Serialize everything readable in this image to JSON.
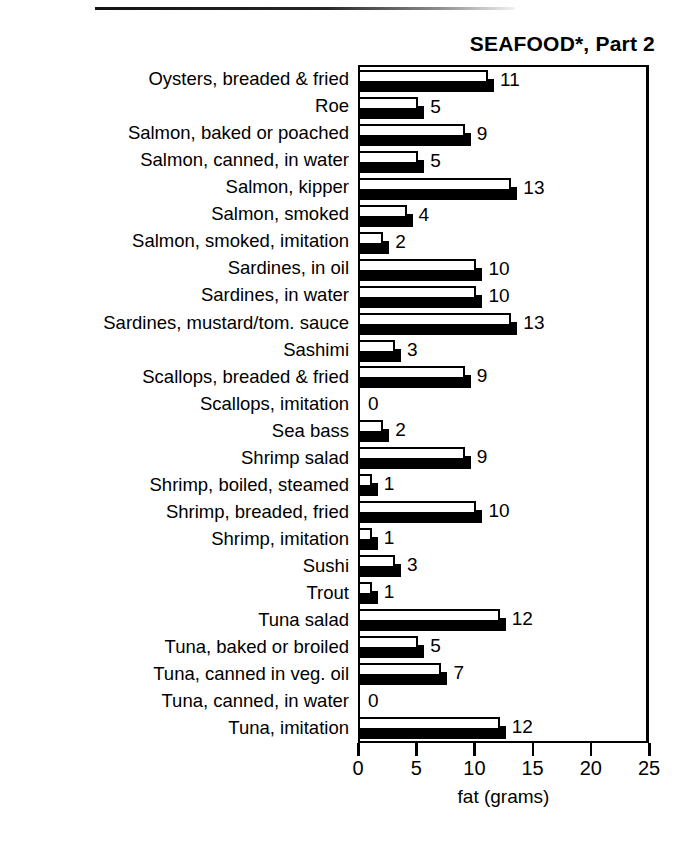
{
  "chart_data": {
    "type": "bar",
    "orientation": "horizontal",
    "title": "SEAFOOD*, Part 2",
    "xlabel": "fat (grams)",
    "ylabel": "",
    "xlim": [
      0,
      25
    ],
    "xticks": [
      0,
      5,
      10,
      15,
      20,
      25
    ],
    "xtick_labels": [
      "0",
      "5",
      "10",
      "15",
      "20",
      "25"
    ],
    "grid": false,
    "legend": null,
    "value_labels": true,
    "categories": [
      "Oysters, breaded & fried",
      "Roe",
      "Salmon, baked or poached",
      "Salmon, canned, in water",
      "Salmon, kipper",
      "Salmon, smoked",
      "Salmon, smoked,  imitation",
      "Sardines, in oil",
      "Sardines, in water",
      "Sardines, mustard/tom. sauce",
      "Sashimi",
      "Scallops, breaded & fried",
      "Scallops, imitation",
      "Sea bass",
      "Shrimp salad",
      "Shrimp, boiled, steamed",
      "Shrimp, breaded, fried",
      "Shrimp, imitation",
      "Sushi",
      "Trout",
      "Tuna salad",
      "Tuna, baked or broiled",
      "Tuna, canned in veg. oil",
      "Tuna, canned, in water",
      "Tuna, imitation"
    ],
    "values": [
      11,
      5,
      9,
      5,
      13,
      4,
      2,
      10,
      10,
      13,
      3,
      9,
      0,
      2,
      9,
      1,
      10,
      1,
      3,
      1,
      12,
      5,
      7,
      0,
      12
    ],
    "value_label_text": [
      "11",
      "5",
      "9",
      "5",
      "13",
      "4",
      "2",
      "10",
      "10",
      "13",
      "3",
      "9",
      "0",
      "2",
      "9",
      "1",
      "10",
      "1",
      "3",
      "1",
      "12",
      "5",
      "7",
      "0",
      "12"
    ]
  },
  "colors": {
    "bar_face": "#ffffff",
    "bar_outline": "#000000",
    "bar_shadow": "#000000",
    "axis": "#000000",
    "background": "#ffffff",
    "text": "#000000"
  }
}
